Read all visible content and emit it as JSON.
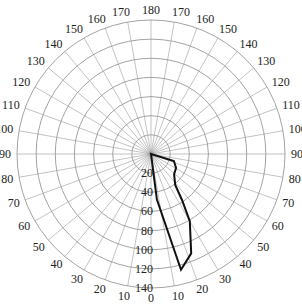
{
  "chart_data": {
    "type": "polar",
    "title": "",
    "angular_axis": {
      "zero_direction": "bottom",
      "symmetric": true,
      "step_deg": 10,
      "left_tick_labels": [
        "0",
        "10",
        "20",
        "30",
        "40",
        "50",
        "60",
        "70",
        "80",
        "90",
        "100",
        "110",
        "120",
        "130",
        "140",
        "150",
        "160",
        "170",
        "180"
      ],
      "right_tick_labels": [
        "0",
        "10",
        "20",
        "30",
        "40",
        "50",
        "60",
        "70",
        "80",
        "90",
        "100",
        "110",
        "120",
        "130",
        "140",
        "150",
        "160",
        "170",
        "180"
      ]
    },
    "radial_axis": {
      "range": [
        0,
        140
      ],
      "tick_step": 20,
      "tick_labels": [
        "20",
        "40",
        "60",
        "80",
        "100",
        "120",
        "140"
      ],
      "grid": true
    },
    "series": [
      {
        "name": "profile",
        "color": "#111111",
        "closed": true,
        "points": [
          {
            "angle": 0,
            "r": 0
          },
          {
            "angle": 73,
            "r": 25
          },
          {
            "angle": 61,
            "r": 30
          },
          {
            "angle": 49,
            "r": 32
          },
          {
            "angle": 38,
            "r": 41
          },
          {
            "angle": 34,
            "r": 58
          },
          {
            "angle": 30,
            "r": 81
          },
          {
            "angle": 22,
            "r": 112
          },
          {
            "angle": 14.5,
            "r": 125
          },
          {
            "angle": 7.4,
            "r": 48
          },
          {
            "angle": 0,
            "r": 0
          }
        ]
      }
    ],
    "legend": null
  },
  "layout": {
    "center_x": 151,
    "center_y": 154,
    "outer_radius_px": 134,
    "colors": {
      "grid": "#8c8c8c",
      "series": "#111111",
      "text": "#222222"
    }
  }
}
